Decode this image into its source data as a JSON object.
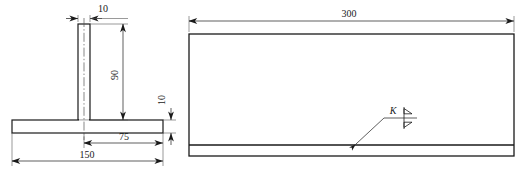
{
  "drawing": {
    "type": "engineering-drawing",
    "background_color": "#ffffff",
    "line_color": "#1a1a1a",
    "thin_line_color": "#555555",
    "views": [
      {
        "name": "cross-section-view",
        "label": "T-section cross section",
        "dimensions": [
          {
            "name": "web-thickness",
            "value": "10",
            "orientation": "horizontal",
            "position": "top"
          },
          {
            "name": "web-height",
            "value": "90",
            "orientation": "vertical",
            "position": "right-of-web"
          },
          {
            "name": "flange-thickness",
            "value": "10",
            "orientation": "vertical",
            "position": "far-right"
          },
          {
            "name": "flange-half-width",
            "value": "75",
            "orientation": "horizontal",
            "position": "below-flange"
          },
          {
            "name": "flange-width",
            "value": "150",
            "orientation": "horizontal",
            "position": "bottom"
          }
        ]
      },
      {
        "name": "elevation-view",
        "label": "Side elevation",
        "dimensions": [
          {
            "name": "overall-length",
            "value": "300",
            "orientation": "horizontal",
            "position": "top"
          }
        ],
        "annotations": [
          {
            "name": "weld-symbol-k",
            "label": "K",
            "symbol": "double-bevel-weld-symbol"
          }
        ]
      }
    ]
  }
}
